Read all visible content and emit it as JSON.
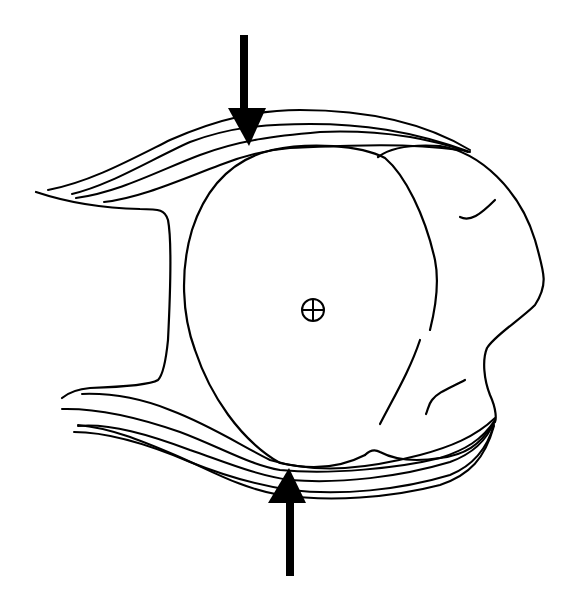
{
  "diagram": {
    "type": "line-art schematic",
    "background": "#ffffff",
    "ink_color": "#000000",
    "components": [
      {
        "id": "round-body",
        "description": "large rounded (disc-like) body in centre"
      },
      {
        "id": "lobed-mass",
        "description": "irregular lobed mass attached to the right side of the round body"
      },
      {
        "id": "upper-fiber-band",
        "description": "band of curved fibres wrapping over the top, converging at the upper right"
      },
      {
        "id": "lower-fiber-band",
        "description": "band of curved fibres wrapping under the bottom, converging at the lower right"
      },
      {
        "id": "left-stalk",
        "description": "C-shaped outline connecting upper and lower bands on the left"
      },
      {
        "id": "center-marker",
        "description": "circle with cross (⊕) marking the centre of rotation"
      },
      {
        "id": "top-force-arrow",
        "description": "downward arrow pressing on the top of the body",
        "direction": "down"
      },
      {
        "id": "bottom-force-arrow",
        "description": "upward arrow pressing on the bottom of the body",
        "direction": "up"
      }
    ],
    "center_symbol": "⊕",
    "text_labels": []
  }
}
